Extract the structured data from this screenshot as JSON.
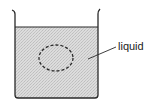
{
  "diagram": {
    "type": "beaker-with-liquid",
    "labels": {
      "liquid": "liquid"
    },
    "colors": {
      "outline": "#2a2a2a",
      "liquid_fill": "#d4d4d4",
      "background": "#ffffff"
    }
  }
}
